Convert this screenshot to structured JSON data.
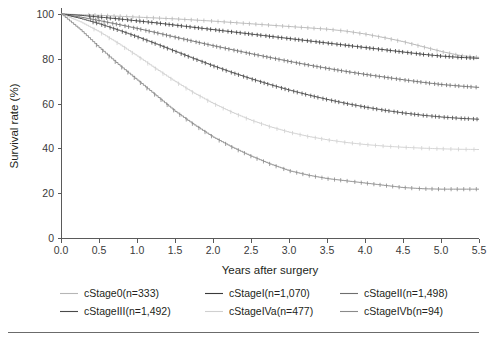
{
  "figure": {
    "width": 487,
    "height": 340,
    "background": "#ffffff"
  },
  "chart_data": {
    "type": "line",
    "title": "",
    "xlabel": "Years after surgery",
    "ylabel": "Survival rate (%)",
    "xlim": [
      0.0,
      5.5
    ],
    "ylim": [
      0,
      100
    ],
    "xticks": [
      "0.0",
      "0.5",
      "1.0",
      "1.5",
      "2.0",
      "2.5",
      "3.0",
      "3.5",
      "4.0",
      "4.5",
      "5.0",
      "5.5"
    ],
    "xtick_values": [
      0.0,
      0.5,
      1.0,
      1.5,
      2.0,
      2.5,
      3.0,
      3.5,
      4.0,
      4.5,
      5.0,
      5.5
    ],
    "yticks": [
      "0",
      "20",
      "40",
      "60",
      "80",
      "100"
    ],
    "ytick_values": [
      0,
      20,
      40,
      60,
      80,
      100
    ],
    "grid": false,
    "legend_position": "below",
    "plot_kind": "kaplan-meier-survival",
    "censor_marks": true,
    "x": [
      0.0,
      0.25,
      0.5,
      0.75,
      1.0,
      1.25,
      1.5,
      1.75,
      2.0,
      2.25,
      2.5,
      2.75,
      3.0,
      3.25,
      3.5,
      3.75,
      4.0,
      4.25,
      4.5,
      4.75,
      5.0,
      5.25,
      5.5
    ],
    "series": [
      {
        "name": "cStage0(n=333)",
        "label": "cStage0",
        "n": 333,
        "color": "#b6b6b6",
        "values": [
          100.0,
          99.7,
          99.4,
          99.0,
          98.6,
          98.2,
          97.8,
          97.3,
          96.8,
          96.2,
          95.6,
          95.0,
          94.4,
          93.8,
          93.2,
          92.3,
          91.0,
          89.4,
          87.6,
          85.4,
          83.2,
          81.4,
          80.6
        ]
      },
      {
        "name": "cStageI(n=1,070)",
        "label": "cStageI",
        "n": 1070,
        "color": "#3a3a3a",
        "values": [
          100.0,
          99.4,
          98.6,
          97.8,
          96.9,
          96.0,
          95.0,
          94.0,
          93.0,
          92.0,
          91.0,
          90.0,
          89.0,
          88.0,
          87.0,
          86.0,
          85.0,
          84.0,
          83.0,
          82.0,
          81.2,
          80.6,
          80.2
        ]
      },
      {
        "name": "cStageII(n=1,498)",
        "label": "cStageII",
        "n": 1498,
        "color": "#6e6e6e",
        "values": [
          100.0,
          98.6,
          97.0,
          95.3,
          93.5,
          91.6,
          89.6,
          87.7,
          85.8,
          84.0,
          82.2,
          80.5,
          78.8,
          77.2,
          75.7,
          74.3,
          73.0,
          71.8,
          70.6,
          69.5,
          68.5,
          67.8,
          67.2
        ]
      },
      {
        "name": "cStageIII(n=1,492)",
        "label": "cStageIII",
        "n": 1492,
        "color": "#4a4a4a",
        "values": [
          100.0,
          98.0,
          95.6,
          92.8,
          89.8,
          86.6,
          83.3,
          80.0,
          76.8,
          73.8,
          71.0,
          68.4,
          66.0,
          63.8,
          61.8,
          60.0,
          58.4,
          57.0,
          55.8,
          54.8,
          54.0,
          53.4,
          53.0
        ]
      },
      {
        "name": "cStageIVa(n=477)",
        "label": "cStageIVa",
        "n": 477,
        "color": "#d0d0d0",
        "values": [
          100.0,
          96.5,
          92.0,
          86.8,
          81.2,
          75.4,
          69.8,
          64.6,
          60.0,
          56.0,
          52.5,
          49.6,
          47.2,
          45.3,
          43.8,
          42.6,
          41.7,
          41.0,
          40.5,
          40.1,
          39.8,
          39.6,
          39.5
        ]
      },
      {
        "name": "cStageIVb(n=94)",
        "label": "cStageIVb",
        "n": 94,
        "color": "#8a8a8a",
        "values": [
          100.0,
          93.0,
          85.0,
          77.5,
          70.5,
          63.5,
          56.5,
          50.5,
          45.0,
          40.5,
          36.5,
          33.0,
          30.0,
          28.0,
          26.5,
          25.5,
          24.5,
          23.5,
          22.5,
          22.0,
          21.8,
          21.8,
          21.8
        ]
      }
    ]
  },
  "legend": {
    "entries": [
      {
        "label": "cStage0(n=333)",
        "color": "#b6b6b6"
      },
      {
        "label": "cStageI(n=1,070)",
        "color": "#3a3a3a"
      },
      {
        "label": "cStageII(n=1,498)",
        "color": "#6e6e6e"
      },
      {
        "label": "cStageIII(n=1,492)",
        "color": "#4a4a4a"
      },
      {
        "label": "cStageIVa(n=477)",
        "color": "#d0d0d0"
      },
      {
        "label": "cStageIVb(n=94)",
        "color": "#8a8a8a"
      }
    ]
  }
}
